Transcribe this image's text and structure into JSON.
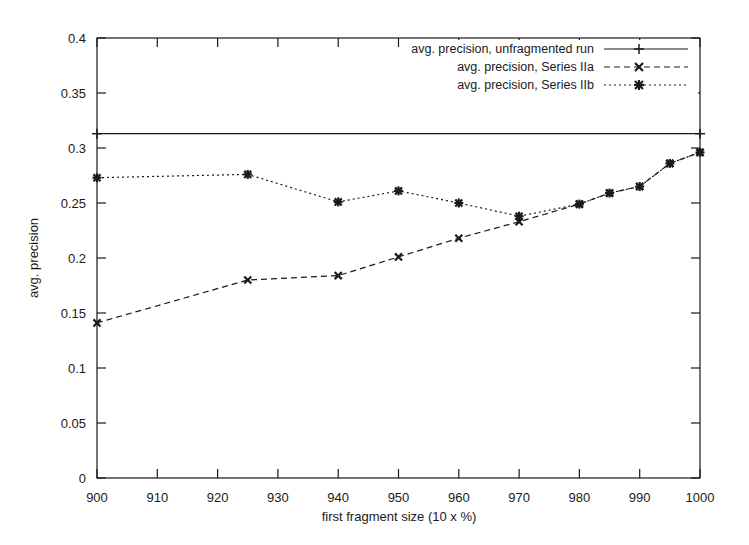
{
  "chart_data": {
    "type": "line",
    "title": "",
    "xlabel": "first fragment size (10 x %)",
    "ylabel": "avg. precision",
    "xlim": [
      900,
      1000
    ],
    "ylim": [
      0,
      0.4
    ],
    "xticks": [
      "900",
      "910",
      "920",
      "930",
      "940",
      "950",
      "960",
      "970",
      "980",
      "990",
      "1000"
    ],
    "yticks": [
      "0",
      "0.05",
      "0.1",
      "0.15",
      "0.2",
      "0.25",
      "0.3",
      "0.35",
      "0.4"
    ],
    "grid": false,
    "legend_position": "top-right",
    "series": [
      {
        "name": "avg. precision, unfragmented run",
        "style": "solid",
        "marker": "plus",
        "x": [
          900,
          1000
        ],
        "values": [
          0.313,
          0.313
        ]
      },
      {
        "name": "avg. precision, Series IIa",
        "style": "dashed",
        "marker": "cross",
        "x": [
          900,
          925,
          940,
          950,
          960,
          970,
          980,
          985,
          990,
          995,
          1000
        ],
        "values": [
          0.141,
          0.18,
          0.184,
          0.201,
          0.218,
          0.233,
          0.249,
          0.259,
          0.265,
          0.286,
          0.296
        ]
      },
      {
        "name": "avg. precision, Series IIb",
        "style": "dotted",
        "marker": "asterisk",
        "x": [
          900,
          925,
          940,
          950,
          960,
          970,
          980,
          985,
          990,
          995,
          1000
        ],
        "values": [
          0.273,
          0.276,
          0.251,
          0.261,
          0.25,
          0.238,
          0.249,
          0.259,
          0.265,
          0.286,
          0.296
        ]
      }
    ]
  },
  "legend": {
    "entries": [
      {
        "label": "avg. precision, unfragmented run"
      },
      {
        "label": "avg. precision, Series IIa"
      },
      {
        "label": "avg. precision, Series IIb"
      }
    ]
  }
}
